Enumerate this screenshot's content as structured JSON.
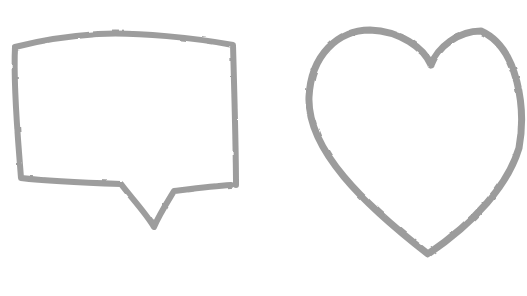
{
  "canvas": {
    "width": 527,
    "height": 296,
    "background_color": "#ffffff",
    "description": "Two hand-drawn sketch shapes: a rectangular speech bubble outline on the left and a heart outline on the right"
  },
  "shapes": {
    "speech_bubble": {
      "label": "speech bubble sketch",
      "stroke_color": "#8f8f8f",
      "stroke_width": "6",
      "fill": "none",
      "path": "M 15 47 C 38 41 68 36 98 34 C 138 32 196 38 233 45 C 234 82 236 148 236 185 M 231 185 C 212 186 190 189 174 191 C 168 201 159 215 154 227 C 146 213 129 195 121 184 C 92 183 46 181 21 178 C 18 138 13 88 15 47"
    },
    "heart": {
      "label": "heart sketch",
      "stroke_color": "#8e8e8e",
      "stroke_width": "7",
      "fill": "none",
      "path": "M 431 65 C 424 48 400 31 370 30 C 338 30 311 55 309 97 C 307 150 365 205 428 254 C 475 222 508 185 519 148 C 526 110 519 48 481 31 C 458 31 438 47 431 65"
    }
  }
}
